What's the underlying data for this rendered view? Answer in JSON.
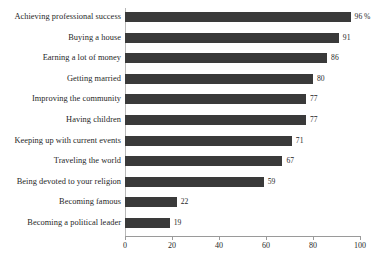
{
  "chart_data": {
    "type": "bar",
    "orientation": "horizontal",
    "title": "",
    "subtitle": "",
    "xlabel": "",
    "ylabel": "",
    "xlim": [
      0,
      100
    ],
    "grid": false,
    "legend": null,
    "unit_suffix": "%",
    "categories": [
      "Achieving professional success",
      "Buying a house",
      "Earning a lot of money",
      "Getting married",
      "Improving the community",
      "Having children",
      "Keeping up with current events",
      "Traveling the world",
      "Being devoted to your religion",
      "Becoming famous",
      "Becoming a political leader"
    ],
    "values": [
      96,
      91,
      86,
      80,
      77,
      77,
      71,
      67,
      59,
      22,
      19
    ],
    "value_labels": [
      "96 %",
      "91",
      "86",
      "80",
      "77",
      "77",
      "71",
      "67",
      "59",
      "22",
      "19"
    ],
    "xticks": [
      0,
      20,
      40,
      60,
      80,
      100
    ],
    "xtick_labels": [
      "0",
      "20",
      "40",
      "60",
      "80",
      "100"
    ],
    "bar_color": "#3a3a3a",
    "axis_color": "#9a9a9a",
    "text_color": "#1f1f1f",
    "background_color": "#ffffff"
  }
}
